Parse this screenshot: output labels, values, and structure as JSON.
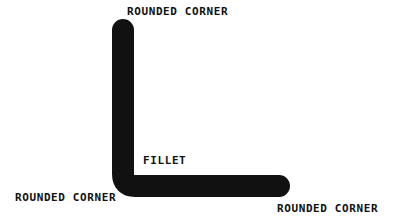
{
  "figure": {
    "title": "",
    "background_color": "#ffffff",
    "ink_color": "#111111",
    "labels": {
      "top": "ROUNDED CORNER",
      "fillet": "FILLET",
      "bottom_left": "ROUNDED CORNER",
      "bottom_right": "ROUNDED CORNER"
    },
    "shape": {
      "name": "filleted-L-bracket",
      "stroke_width_px": 22,
      "vertical_leg": {
        "x_left": 112,
        "x_right": 134,
        "y_top": 19,
        "y_bottom": 197
      },
      "horizontal_leg": {
        "y_top": 175,
        "y_bottom": 197,
        "x_left": 112,
        "x_right": 290
      },
      "cap_radius_px": 11,
      "inner_fillet_radius_px": 12,
      "outer_corner_radius_px": 11
    }
  }
}
